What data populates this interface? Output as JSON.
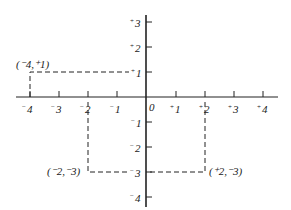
{
  "diagram": {
    "type": "coordinate-plane",
    "colors": {
      "ink": "#222222",
      "background": "#ffffff"
    },
    "x_axis": {
      "ticks": [
        {
          "value": -4,
          "sign": "−",
          "num": "4"
        },
        {
          "value": -3,
          "sign": "−",
          "num": "3"
        },
        {
          "value": -2,
          "sign": "−",
          "num": "2"
        },
        {
          "value": -1,
          "sign": "−",
          "num": "1"
        },
        {
          "value": 0,
          "sign": "",
          "num": "0"
        },
        {
          "value": 1,
          "sign": "+",
          "num": "1"
        },
        {
          "value": 2,
          "sign": "+",
          "num": "2"
        },
        {
          "value": 3,
          "sign": "+",
          "num": "3"
        },
        {
          "value": 4,
          "sign": "+",
          "num": "4"
        }
      ]
    },
    "y_axis": {
      "ticks": [
        {
          "value": 3,
          "sign": "+",
          "num": "3"
        },
        {
          "value": 2,
          "sign": "+",
          "num": "2"
        },
        {
          "value": 1,
          "sign": "+",
          "num": "1"
        },
        {
          "value": -1,
          "sign": "−",
          "num": "1"
        },
        {
          "value": -2,
          "sign": "−",
          "num": "2"
        },
        {
          "value": -3,
          "sign": "−",
          "num": "3"
        },
        {
          "value": -4,
          "sign": "−",
          "num": "4"
        }
      ]
    },
    "points": [
      {
        "x": -4,
        "y": 1,
        "label": "(⁻4,⁺1)"
      },
      {
        "x": -2,
        "y": -3,
        "label": "(⁻2,⁻3)"
      },
      {
        "x": 2,
        "y": -3,
        "label": "(⁺2,⁻3)"
      }
    ]
  }
}
